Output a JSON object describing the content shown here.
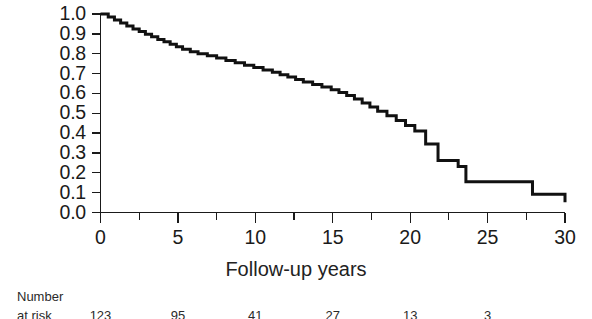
{
  "chart_data": {
    "type": "line",
    "subtype": "kaplan-meier-step",
    "title": "",
    "xlabel": "Follow-up years",
    "ylabel": "",
    "xlim": [
      0,
      30
    ],
    "ylim": [
      0,
      1.0
    ],
    "grid": false,
    "legend": "none",
    "x_ticks": [
      0,
      5,
      10,
      15,
      20,
      25,
      30
    ],
    "x_tick_labels": [
      "0",
      "5",
      "10",
      "15",
      "20",
      "25",
      "30"
    ],
    "x_minor_ticks": [
      2.5,
      7.5,
      12.5,
      17.5,
      22.5,
      27.5
    ],
    "y_ticks": [
      0.0,
      0.1,
      0.2,
      0.3,
      0.4,
      0.5,
      0.6,
      0.7,
      0.8,
      0.9,
      1.0
    ],
    "y_tick_labels": [
      "0.0",
      "0.1",
      "0.2",
      "0.3",
      "0.4",
      "0.5",
      "0.6",
      "0.7",
      "0.8",
      "0.9",
      "1.0"
    ],
    "series": [
      {
        "name": "survival",
        "color": "#111111",
        "x": [
          0,
          0.5,
          0.9,
          1.3,
          1.7,
          2.1,
          2.5,
          2.9,
          3.3,
          3.7,
          4.1,
          4.5,
          4.9,
          5.3,
          5.8,
          6.3,
          6.9,
          7.5,
          8.1,
          8.7,
          9.3,
          9.9,
          10.5,
          11.1,
          11.6,
          12.1,
          12.6,
          13.1,
          13.7,
          14.3,
          14.9,
          15.4,
          15.9,
          16.4,
          16.9,
          17.4,
          17.9,
          18.5,
          19.1,
          19.7,
          20.3,
          21.0,
          21.8,
          23.1,
          23.6,
          27.9,
          30
        ],
        "y": [
          1.0,
          0.985,
          0.97,
          0.955,
          0.94,
          0.925,
          0.912,
          0.898,
          0.885,
          0.872,
          0.86,
          0.848,
          0.835,
          0.822,
          0.81,
          0.8,
          0.79,
          0.778,
          0.766,
          0.754,
          0.742,
          0.73,
          0.718,
          0.706,
          0.694,
          0.682,
          0.67,
          0.658,
          0.645,
          0.632,
          0.618,
          0.605,
          0.59,
          0.572,
          0.552,
          0.532,
          0.51,
          0.487,
          0.463,
          0.438,
          0.41,
          0.345,
          0.262,
          0.232,
          0.155,
          0.092,
          0.052
        ]
      }
    ]
  },
  "axis": {
    "x_label": "Follow-up years",
    "y_labels": [
      "1.0",
      "0.9",
      "0.8",
      "0.7",
      "0.6",
      "0.5",
      "0.4",
      "0.3",
      "0.2",
      "0.1",
      "0.0"
    ],
    "x_labels": [
      "0",
      "5",
      "10",
      "15",
      "20",
      "25",
      "30"
    ]
  },
  "risk_table": {
    "title": "Number",
    "row_label": "at risk",
    "values": [
      "123",
      "95",
      "41",
      "27",
      "13",
      "3"
    ],
    "positions": [
      0,
      5,
      10,
      15,
      20,
      25
    ]
  }
}
